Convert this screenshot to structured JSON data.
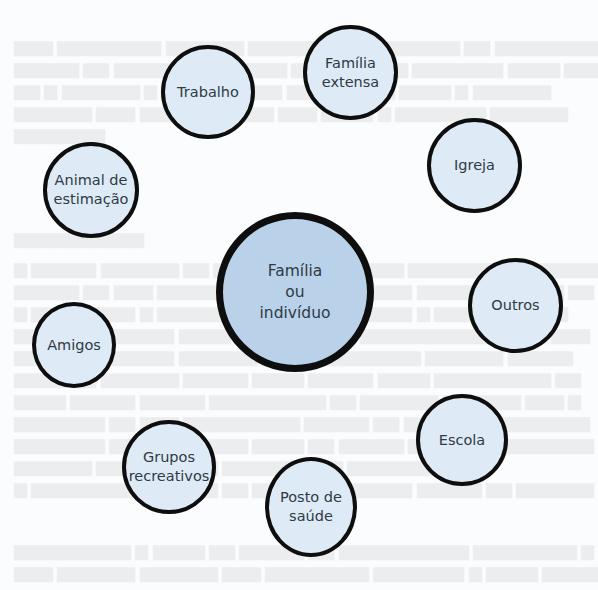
{
  "diagram": {
    "type": "ecomap",
    "colors": {
      "border": "#0e0e0e",
      "node_fill": "#deebf7",
      "center_fill": "#b9d2ea",
      "text": "#2f3a44",
      "background": "#fbfcfd"
    },
    "center": {
      "label": "Família\nou\nindivíduo"
    },
    "nodes": [
      {
        "id": "trabalho",
        "label": "Trabalho"
      },
      {
        "id": "familia-extensa",
        "label": "Família\nextensa"
      },
      {
        "id": "igreja",
        "label": "Igreja"
      },
      {
        "id": "animal-de-estimacao",
        "label": "Animal de\nestimação"
      },
      {
        "id": "outros",
        "label": "Outros"
      },
      {
        "id": "amigos",
        "label": "Amigos"
      },
      {
        "id": "escola",
        "label": "Escola"
      },
      {
        "id": "grupos-recreativos",
        "label": "Grupos\nrecreativos"
      },
      {
        "id": "posto-de-saude",
        "label": "Posto de\nsaúde"
      }
    ]
  }
}
